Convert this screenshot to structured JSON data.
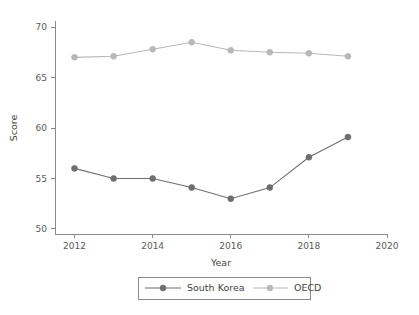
{
  "chart_data": {
    "type": "line",
    "title": "",
    "xlabel": "Year",
    "ylabel": "Score",
    "x": [
      2012,
      2013,
      2014,
      2015,
      2016,
      2017,
      2018,
      2019
    ],
    "xlim": [
      2011.5,
      2020
    ],
    "ylim": [
      49.5,
      70.5
    ],
    "xticks": [
      2012,
      2014,
      2016,
      2018,
      2020
    ],
    "xtick_labels": [
      "2012",
      "2014",
      "2016",
      "2018",
      "2020"
    ],
    "yticks": [
      50,
      55,
      60,
      65,
      70
    ],
    "ytick_labels": [
      "50",
      "55",
      "60",
      "65",
      "70"
    ],
    "grid": false,
    "legend_position": "bottom",
    "series": [
      {
        "name": "South Korea",
        "color": "#6e6e6e",
        "marker": "circle",
        "values": [
          56.0,
          55.0,
          55.0,
          54.1,
          53.0,
          54.1,
          57.1,
          59.1
        ]
      },
      {
        "name": "OECD",
        "color": "#b8b8b8",
        "marker": "circle",
        "values": [
          67.0,
          67.1,
          67.8,
          68.5,
          67.7,
          67.5,
          67.4,
          67.1
        ]
      }
    ]
  },
  "legend": {
    "entries": [
      {
        "label": "South Korea",
        "color": "#6e6e6e"
      },
      {
        "label": "OECD",
        "color": "#b8b8b8"
      }
    ]
  },
  "axes": {
    "x_title": "Year",
    "y_title": "Score"
  },
  "colors": {
    "axis": "#8a8a8a",
    "text": "#3f3f3f",
    "background": "#ffffff",
    "series_primary": "#6e6e6e",
    "series_secondary": "#b8b8b8"
  }
}
